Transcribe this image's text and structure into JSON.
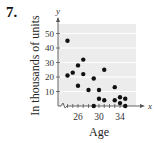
{
  "problem_number": "7.",
  "chart_data": {
    "type": "scatter",
    "title": "",
    "xlabel": "Age",
    "ylabel": "In thousands of units",
    "x_axis_symbol": "x",
    "y_axis_symbol": "y",
    "x_ticks": [
      26,
      30,
      34
    ],
    "y_ticks": [
      10,
      20,
      30,
      40,
      50
    ],
    "xlim": [
      23,
      36
    ],
    "ylim": [
      0,
      55
    ],
    "grid": "horizontal",
    "axis_break": "x",
    "points": [
      {
        "x": 24,
        "y": 45
      },
      {
        "x": 24,
        "y": 21
      },
      {
        "x": 25,
        "y": 23
      },
      {
        "x": 26,
        "y": 28
      },
      {
        "x": 26,
        "y": 14
      },
      {
        "x": 27,
        "y": 32
      },
      {
        "x": 27,
        "y": 22
      },
      {
        "x": 28,
        "y": 11
      },
      {
        "x": 29,
        "y": 19
      },
      {
        "x": 29,
        "y": 0
      },
      {
        "x": 30,
        "y": 11
      },
      {
        "x": 30,
        "y": 5
      },
      {
        "x": 31,
        "y": 25
      },
      {
        "x": 31,
        "y": 4
      },
      {
        "x": 33,
        "y": 13
      },
      {
        "x": 33,
        "y": 4
      },
      {
        "x": 34,
        "y": 6
      },
      {
        "x": 34,
        "y": 2
      },
      {
        "x": 35,
        "y": 5
      },
      {
        "x": 35,
        "y": 0
      }
    ]
  },
  "colors": {
    "plot_bg": "#ececec",
    "grid": "#ffffff",
    "point": "#111111",
    "axis": "#555555"
  }
}
